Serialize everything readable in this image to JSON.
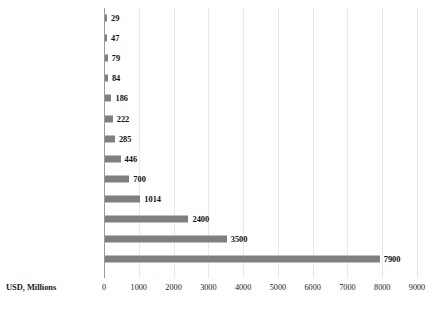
{
  "chart_data": {
    "type": "bar",
    "orientation": "horizontal",
    "title": "",
    "xlabel": "USD, Millions",
    "ylabel": "",
    "xlim": [
      0,
      9000
    ],
    "xticks": [
      0,
      1000,
      2000,
      3000,
      4000,
      5000,
      6000,
      7000,
      8000,
      9000
    ],
    "xtick_labels": [
      "0",
      "1000",
      "2000",
      "3000",
      "4000",
      "5000",
      "6000",
      "7000",
      "8000",
      "9000"
    ],
    "grid": true,
    "legend": false,
    "bar_color": "#808080",
    "categories": [
      "Australia",
      "Africa (a)",
      "Ireland",
      "Singapore",
      "Israel",
      "France",
      "UK",
      "Rest of the World (b)",
      "Brazil",
      "Rest of Europe",
      "India (c)",
      "China",
      "U.S."
    ],
    "values": [
      29,
      47,
      79,
      84,
      186,
      222,
      285,
      446,
      700,
      1014,
      2400,
      3500,
      7900
    ],
    "value_labels": [
      "29",
      "47",
      "79",
      "84",
      "186",
      "222",
      "285",
      "446",
      "700",
      "1014",
      "2400",
      "3500",
      "7900"
    ]
  }
}
